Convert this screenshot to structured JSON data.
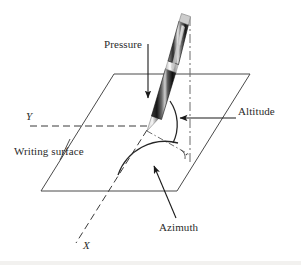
{
  "figure": {
    "background_color": "#ffffff",
    "line_color": "#3a3a3a",
    "text_color": "#2b2b2b",
    "labels": {
      "pressure": "Pressure",
      "altitude": "Altitude",
      "writing_surface": "Writing surface",
      "azimuth": "Azimuth",
      "axis_y": "Y",
      "axis_x": "X"
    },
    "elements": {
      "plane_name": "writing-surface-plane",
      "pen_name": "stylus-pen",
      "vertical_axis_name": "vertical-normal-axis",
      "altitude_arc_name": "altitude-angle-arc",
      "azimuth_arc_name": "azimuth-angle-arc",
      "right_angle_name": "right-angle-marker"
    }
  }
}
